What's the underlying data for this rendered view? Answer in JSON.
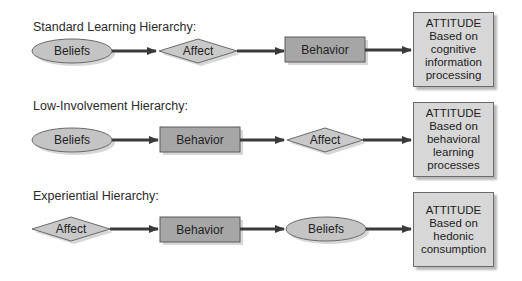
{
  "colors": {
    "ellipse_fill": "#c4c4c4",
    "diamond_fill": "#c9c9c9",
    "rect_fill": "#a6a6a6",
    "attitude_fill": "#d7d7d7",
    "arrow": "#3a3a3a",
    "outline": "#6a6a6a"
  },
  "hierarchies": [
    {
      "title": "Standard Learning Hierarchy:",
      "steps": [
        {
          "label": "Beliefs",
          "shape": "ellipse"
        },
        {
          "label": "Affect",
          "shape": "diamond"
        },
        {
          "label": "Behavior",
          "shape": "rectangle"
        }
      ],
      "outcome": {
        "heading": "ATTITUDE",
        "lines": [
          "Based on",
          "cognitive",
          "information",
          "processing"
        ]
      }
    },
    {
      "title": "Low-Involvement Hierarchy:",
      "steps": [
        {
          "label": "Beliefs",
          "shape": "ellipse"
        },
        {
          "label": "Behavior",
          "shape": "rectangle"
        },
        {
          "label": "Affect",
          "shape": "diamond"
        }
      ],
      "outcome": {
        "heading": "ATTITUDE",
        "lines": [
          "Based on",
          "behavioral",
          "learning",
          "processes"
        ]
      }
    },
    {
      "title": "Experiential Hierarchy:",
      "steps": [
        {
          "label": "Affect",
          "shape": "diamond"
        },
        {
          "label": "Behavior",
          "shape": "rectangle"
        },
        {
          "label": "Beliefs",
          "shape": "ellipse"
        }
      ],
      "outcome": {
        "heading": "ATTITUDE",
        "lines": [
          "Based on",
          "hedonic",
          "consumption"
        ]
      }
    }
  ]
}
